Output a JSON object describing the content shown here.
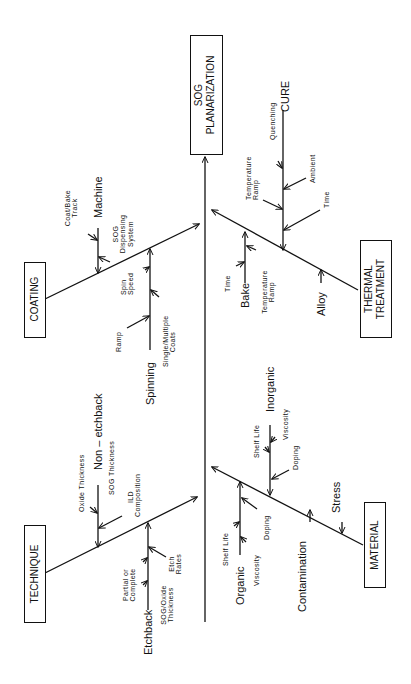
{
  "diagram": {
    "type": "fishbone",
    "orientation": "rotated -90deg (head at top)",
    "effect": {
      "line1": "SOG",
      "line2": "PLANARIZATION"
    },
    "categories": {
      "coating": {
        "label": "COATING",
        "sub": {
          "machine": {
            "label": "Machine",
            "causes": [
              "Coat/Bake Track",
              "SOG Dispensing System"
            ]
          },
          "spinning": {
            "label": "Spinning",
            "causes": [
              "Spin Speed",
              "Ramp",
              "Single/Multiple Coats"
            ]
          }
        }
      },
      "technique": {
        "label": "TECHNIQUE",
        "sub": {
          "non_etchback": {
            "label": "Non – etchback",
            "causes": [
              "Oxide Thickness",
              "SOG Thickness",
              "ILD Composition"
            ]
          },
          "etchback": {
            "label": "Etchback",
            "causes": [
              "Partial or Complete",
              "SOG/Oxide Thickness",
              "Etch Rates"
            ]
          }
        }
      },
      "thermal": {
        "label_line1": "THERMAL",
        "label_line2": "TREATMENT",
        "sub": {
          "cure": {
            "label": "CURE",
            "causes": [
              "Temperature Ramp",
              "Quenching",
              "Ambient",
              "Time"
            ]
          },
          "bake": {
            "label": "Bake",
            "causes": [
              "Time",
              "Temperature Ramp"
            ]
          },
          "alloy": {
            "label": "Alloy"
          }
        }
      },
      "material": {
        "label": "MATERIAL",
        "sub": {
          "inorganic": {
            "label": "Inorganic",
            "causes": [
              "Shelf Life",
              "Viscosity",
              "Doping"
            ]
          },
          "organic": {
            "label": "Organic",
            "causes": [
              "Shelf Life",
              "Viscosity",
              "Doping"
            ]
          },
          "contamination": {
            "label": "Contamination"
          },
          "stress": {
            "label": "Stress"
          }
        }
      }
    },
    "colors": {
      "ink": "#111111",
      "background": "#ffffff"
    }
  }
}
